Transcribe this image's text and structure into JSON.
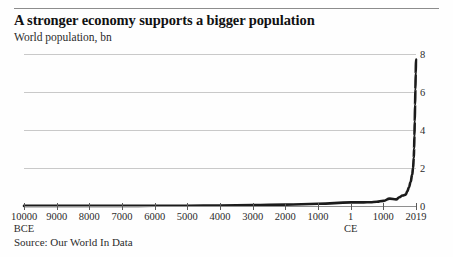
{
  "header": {
    "title": "A stronger economy supports a bigger population",
    "subtitle": "World population, bn"
  },
  "footer": {
    "source": "Source: Our World In Data"
  },
  "colors": {
    "line": "#1b1b1b",
    "grid": "#c9c9c9",
    "axis": "#8f8f8f",
    "rule": "#8c8c8c",
    "background": "#fefefe",
    "text": "#2b2b2b"
  },
  "chart_data": {
    "type": "line",
    "title": "A stronger economy supports a bigger population",
    "subtitle": "World population, bn",
    "xlabel": "",
    "ylabel": "World population, bn",
    "ylim": [
      0,
      8
    ],
    "yticks": [
      0,
      2,
      4,
      6,
      8
    ],
    "ytick_labels": [
      "0",
      "2",
      "4",
      "6",
      "8"
    ],
    "y_axis_position": "right",
    "grid": true,
    "legend": false,
    "xtick_labels": [
      "10000",
      "9000",
      "8000",
      "7000",
      "6000",
      "5000",
      "4000",
      "3000",
      "2000",
      "1000",
      "1",
      "1000",
      "2019"
    ],
    "xtick_eras": {
      "10000": "BCE",
      "1": "CE"
    },
    "xlim_years": [
      -10000,
      2019
    ],
    "x": [
      -10000,
      -9000,
      -8000,
      -7000,
      -6000,
      -5000,
      -4000,
      -3000,
      -2000,
      -1000,
      1,
      200,
      400,
      600,
      800,
      1000,
      1200,
      1400,
      1500,
      1600,
      1700,
      1750,
      1800,
      1850,
      1900,
      1927,
      1950,
      1960,
      1970,
      1980,
      1990,
      2000,
      2010,
      2019
    ],
    "values": [
      0.004,
      0.005,
      0.006,
      0.007,
      0.01,
      0.015,
      0.028,
      0.045,
      0.072,
      0.115,
      0.19,
      0.19,
      0.19,
      0.2,
      0.22,
      0.27,
      0.39,
      0.35,
      0.46,
      0.55,
      0.6,
      0.79,
      0.99,
      1.26,
      1.65,
      2.0,
      2.54,
      3.03,
      3.7,
      4.45,
      5.33,
      6.14,
      6.96,
      7.71
    ],
    "series_name": "World population",
    "annotations": []
  }
}
